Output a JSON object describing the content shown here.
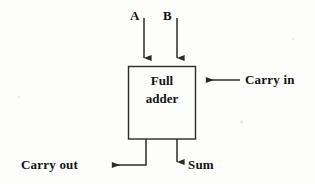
{
  "diagram": {
    "block": {
      "label_line1": "Full",
      "label_line2": "adder",
      "x": 128,
      "y": 66,
      "width": 68,
      "height": 73
    },
    "inputs": [
      {
        "name": "A",
        "label": "A",
        "direction": "down",
        "x": 144
      },
      {
        "name": "B",
        "label": "B",
        "direction": "down",
        "x": 177
      },
      {
        "name": "carry-in",
        "label": "Carry in",
        "direction": "left",
        "y": 80
      }
    ],
    "outputs": [
      {
        "name": "carry-out",
        "label": "Carry out",
        "direction": "left"
      },
      {
        "name": "sum",
        "label": "Sum",
        "direction": "down"
      }
    ],
    "colors": {
      "stroke": "#2b2b2b",
      "text": "#131313",
      "background": "#fdfdfc"
    }
  }
}
